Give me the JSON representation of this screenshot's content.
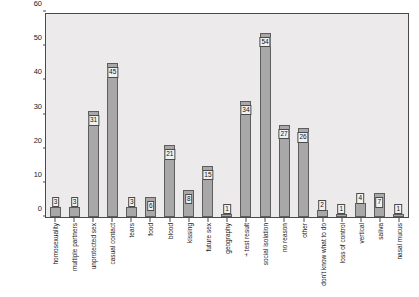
{
  "chart_data": {
    "type": "bar",
    "title": "",
    "xlabel": "",
    "ylabel": "Frequency",
    "ylim": [
      0,
      60
    ],
    "yticks": [
      0,
      10,
      20,
      30,
      40,
      50,
      60
    ],
    "grid": false,
    "legend": "none",
    "bar_color": "#a8a8a8",
    "bar_edge_color": "#5d5d5d",
    "plot_background": "#eceaea",
    "categories": [
      "homosexuality",
      "multiple partners",
      "unprotected sex",
      "casual contact",
      "tears",
      "food",
      "blood",
      "kissing",
      "future sex",
      "geography",
      "+ test result",
      "social isolation",
      "no reason",
      "other",
      "don't know what to do",
      "loss of control",
      "vertical",
      "saliva",
      "nasal mucus"
    ],
    "values": [
      3,
      3,
      31,
      45,
      3,
      6,
      21,
      8,
      15,
      1,
      34,
      54,
      27,
      26,
      2,
      1,
      4,
      7,
      1
    ],
    "value_labels": [
      "3",
      "3",
      "31",
      "45",
      "3",
      "6",
      "21",
      "8",
      "15",
      "1",
      "34",
      "54",
      "27",
      "26",
      "2",
      "1",
      "4",
      "7",
      "1"
    ]
  }
}
